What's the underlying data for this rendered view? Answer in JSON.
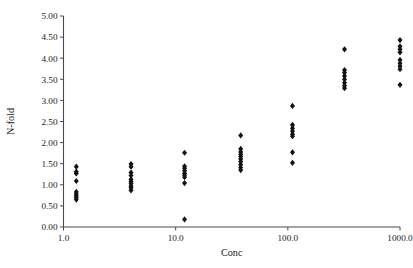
{
  "chart_data": {
    "type": "scatter",
    "title": "",
    "xlabel": "Conc",
    "ylabel": "N-fold",
    "xscale": "log",
    "yscale": "linear",
    "xlim": [
      1.0,
      1000.0
    ],
    "ylim": [
      0.0,
      5.0
    ],
    "grid": false,
    "legend": null,
    "marker": "diamond",
    "marker_color": "#121212",
    "xticks": [
      1.0,
      10.0,
      100.0,
      1000.0
    ],
    "xtick_labels": [
      "1.0",
      "10.0",
      "100.0",
      "1000.0"
    ],
    "yticks": [
      0.0,
      0.5,
      1.0,
      1.5,
      2.0,
      2.5,
      3.0,
      3.5,
      4.0,
      4.5,
      5.0
    ],
    "ytick_labels": [
      "0.00",
      "0.50",
      "1.00",
      "1.50",
      "2.00",
      "2.50",
      "3.00",
      "3.50",
      "4.00",
      "4.50",
      "5.00"
    ],
    "groups": [
      {
        "conc": 1.3,
        "values": [
          1.43,
          1.31,
          1.27,
          1.09,
          0.83,
          0.78,
          0.74,
          0.7,
          0.65
        ]
      },
      {
        "conc": 4.0,
        "values": [
          1.49,
          1.43,
          1.29,
          1.22,
          1.13,
          1.08,
          1.03,
          0.97,
          0.93,
          0.87
        ]
      },
      {
        "conc": 12.0,
        "values": [
          1.76,
          1.44,
          1.39,
          1.33,
          1.27,
          1.23,
          1.18,
          1.04,
          0.18
        ]
      },
      {
        "conc": 38.0,
        "values": [
          2.17,
          1.85,
          1.78,
          1.72,
          1.67,
          1.61,
          1.55,
          1.48,
          1.41,
          1.35
        ]
      },
      {
        "conc": 110.0,
        "values": [
          2.87,
          2.42,
          2.34,
          2.27,
          2.2,
          2.15,
          1.77,
          1.52
        ]
      },
      {
        "conc": 320.0,
        "values": [
          4.21,
          3.72,
          3.66,
          3.58,
          3.5,
          3.42,
          3.35,
          3.29
        ]
      },
      {
        "conc": 1000.0,
        "values": [
          4.43,
          4.28,
          4.21,
          4.14,
          3.96,
          3.88,
          3.81,
          3.74,
          3.37
        ]
      }
    ],
    "points": [
      {
        "x": 1.3,
        "y": 1.43
      },
      {
        "x": 1.3,
        "y": 1.31
      },
      {
        "x": 1.3,
        "y": 1.27
      },
      {
        "x": 1.3,
        "y": 1.09
      },
      {
        "x": 1.3,
        "y": 0.83
      },
      {
        "x": 1.3,
        "y": 0.78
      },
      {
        "x": 1.3,
        "y": 0.74
      },
      {
        "x": 1.3,
        "y": 0.7
      },
      {
        "x": 1.3,
        "y": 0.65
      },
      {
        "x": 4.0,
        "y": 1.49
      },
      {
        "x": 4.0,
        "y": 1.43
      },
      {
        "x": 4.0,
        "y": 1.29
      },
      {
        "x": 4.0,
        "y": 1.22
      },
      {
        "x": 4.0,
        "y": 1.13
      },
      {
        "x": 4.0,
        "y": 1.08
      },
      {
        "x": 4.0,
        "y": 1.03
      },
      {
        "x": 4.0,
        "y": 0.97
      },
      {
        "x": 4.0,
        "y": 0.93
      },
      {
        "x": 4.0,
        "y": 0.87
      },
      {
        "x": 12.0,
        "y": 1.76
      },
      {
        "x": 12.0,
        "y": 1.44
      },
      {
        "x": 12.0,
        "y": 1.39
      },
      {
        "x": 12.0,
        "y": 1.33
      },
      {
        "x": 12.0,
        "y": 1.27
      },
      {
        "x": 12.0,
        "y": 1.23
      },
      {
        "x": 12.0,
        "y": 1.18
      },
      {
        "x": 12.0,
        "y": 1.04
      },
      {
        "x": 12.0,
        "y": 0.18
      },
      {
        "x": 38.0,
        "y": 2.17
      },
      {
        "x": 38.0,
        "y": 1.85
      },
      {
        "x": 38.0,
        "y": 1.78
      },
      {
        "x": 38.0,
        "y": 1.72
      },
      {
        "x": 38.0,
        "y": 1.67
      },
      {
        "x": 38.0,
        "y": 1.61
      },
      {
        "x": 38.0,
        "y": 1.55
      },
      {
        "x": 38.0,
        "y": 1.48
      },
      {
        "x": 38.0,
        "y": 1.41
      },
      {
        "x": 38.0,
        "y": 1.35
      },
      {
        "x": 110.0,
        "y": 2.87
      },
      {
        "x": 110.0,
        "y": 2.42
      },
      {
        "x": 110.0,
        "y": 2.34
      },
      {
        "x": 110.0,
        "y": 2.27
      },
      {
        "x": 110.0,
        "y": 2.2
      },
      {
        "x": 110.0,
        "y": 2.15
      },
      {
        "x": 110.0,
        "y": 1.77
      },
      {
        "x": 110.0,
        "y": 1.52
      },
      {
        "x": 320.0,
        "y": 4.21
      },
      {
        "x": 320.0,
        "y": 3.72
      },
      {
        "x": 320.0,
        "y": 3.66
      },
      {
        "x": 320.0,
        "y": 3.58
      },
      {
        "x": 320.0,
        "y": 3.5
      },
      {
        "x": 320.0,
        "y": 3.42
      },
      {
        "x": 320.0,
        "y": 3.35
      },
      {
        "x": 320.0,
        "y": 3.29
      },
      {
        "x": 1000.0,
        "y": 4.43
      },
      {
        "x": 1000.0,
        "y": 4.28
      },
      {
        "x": 1000.0,
        "y": 4.21
      },
      {
        "x": 1000.0,
        "y": 4.14
      },
      {
        "x": 1000.0,
        "y": 3.96
      },
      {
        "x": 1000.0,
        "y": 3.88
      },
      {
        "x": 1000.0,
        "y": 3.81
      },
      {
        "x": 1000.0,
        "y": 3.74
      },
      {
        "x": 1000.0,
        "y": 3.37
      }
    ]
  }
}
